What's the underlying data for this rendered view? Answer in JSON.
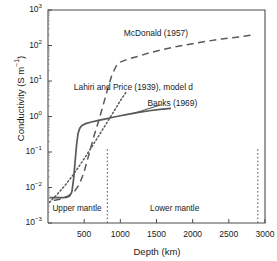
{
  "chart_data": {
    "type": "line",
    "title": "",
    "xlabel": "Depth (km)",
    "ylabel": "Conductivity (S m⁻¹)",
    "xlim": [
      0,
      3000
    ],
    "ylim": [
      0.001,
      1000
    ],
    "yscale": "log",
    "xscale": "linear",
    "grid": false,
    "legend_position": "inline-annotations",
    "xticks": [
      {
        "value": 500,
        "label": "500"
      },
      {
        "value": 1000,
        "label": "1000"
      },
      {
        "value": 1500,
        "label": "1500"
      },
      {
        "value": 2000,
        "label": "2000"
      },
      {
        "value": 2500,
        "label": "2500"
      },
      {
        "value": 3000,
        "label": "3000"
      }
    ],
    "yticks": [
      {
        "value": 0.001,
        "mantissa": "10",
        "exponent": "-3"
      },
      {
        "value": 0.01,
        "mantissa": "10",
        "exponent": "-2"
      },
      {
        "value": 0.1,
        "mantissa": "10",
        "exponent": "-1"
      },
      {
        "value": 1,
        "mantissa": "10",
        "exponent": "0"
      },
      {
        "value": 10,
        "mantissa": "10",
        "exponent": "1"
      },
      {
        "value": 100,
        "mantissa": "10",
        "exponent": "2"
      },
      {
        "value": 1000,
        "mantissa": "10",
        "exponent": "3"
      }
    ],
    "series": [
      {
        "name": "Banks (1969)",
        "style": "solid",
        "color": "#595959",
        "label_x": 1720,
        "label_y": 2.3,
        "points": [
          [
            20,
            0.0052
          ],
          [
            120,
            0.0052
          ],
          [
            200,
            0.0052
          ],
          [
            260,
            0.0053
          ],
          [
            300,
            0.0058
          ],
          [
            330,
            0.0075
          ],
          [
            355,
            0.018
          ],
          [
            375,
            0.055
          ],
          [
            395,
            0.16
          ],
          [
            415,
            0.33
          ],
          [
            440,
            0.47
          ],
          [
            470,
            0.56
          ],
          [
            520,
            0.63
          ],
          [
            600,
            0.7
          ],
          [
            700,
            0.78
          ],
          [
            800,
            0.86
          ],
          [
            900,
            0.95
          ],
          [
            1000,
            1.05
          ],
          [
            1100,
            1.15
          ],
          [
            1250,
            1.3
          ],
          [
            1400,
            1.45
          ],
          [
            1550,
            1.58
          ],
          [
            1700,
            1.7
          ]
        ]
      },
      {
        "name": "Lahiri and Price (1939), model d",
        "style": "dotted",
        "color": "#595959",
        "label_x": 1180,
        "label_y": 6.5,
        "points": [
          [
            20,
            0.0038
          ],
          [
            120,
            0.0062
          ],
          [
            220,
            0.0105
          ],
          [
            320,
            0.019
          ],
          [
            420,
            0.037
          ],
          [
            520,
            0.075
          ],
          [
            620,
            0.155
          ],
          [
            720,
            0.33
          ],
          [
            820,
            0.7
          ],
          [
            920,
            1.5
          ],
          [
            1010,
            3.0
          ],
          [
            1090,
            5.2
          ]
        ]
      },
      {
        "name": "McDonald (1957)",
        "style": "dashed",
        "color": "#595959",
        "label_x": 1490,
        "label_y": 215,
        "points": [
          [
            80,
            0.0043
          ],
          [
            180,
            0.0048
          ],
          [
            280,
            0.0058
          ],
          [
            360,
            0.0075
          ],
          [
            430,
            0.012
          ],
          [
            490,
            0.024
          ],
          [
            540,
            0.055
          ],
          [
            590,
            0.13
          ],
          [
            640,
            0.3
          ],
          [
            700,
            0.75
          ],
          [
            760,
            2.0
          ],
          [
            820,
            5.5
          ],
          [
            880,
            14.0
          ],
          [
            940,
            26.0
          ],
          [
            1000,
            34.0
          ],
          [
            1100,
            41.0
          ],
          [
            1250,
            50.0
          ],
          [
            1400,
            62.0
          ],
          [
            1600,
            78.0
          ],
          [
            1800,
            95.0
          ],
          [
            2000,
            112.0
          ],
          [
            2200,
            132.0
          ],
          [
            2400,
            152.0
          ],
          [
            2650,
            175.0
          ],
          [
            2850,
            200.0
          ]
        ]
      }
    ],
    "boundaries": [
      {
        "name": "upper-lower-mantle-boundary",
        "depth": 820
      },
      {
        "name": "core-mantle-boundary",
        "depth": 2900
      }
    ],
    "regions": [
      {
        "name": "Upper mantle",
        "center_depth": 400,
        "label_y": 0.0023
      },
      {
        "name": "Lower mantle",
        "center_depth": 1750,
        "label_y": 0.0023
      }
    ]
  }
}
